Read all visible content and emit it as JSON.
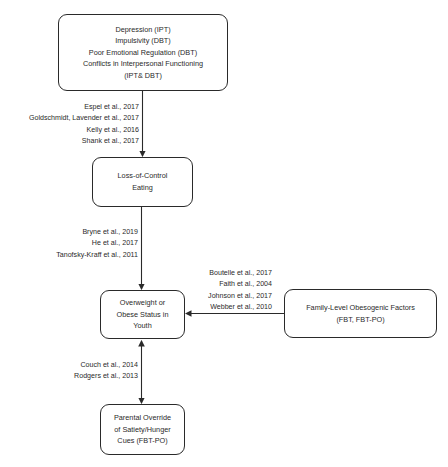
{
  "diagram": {
    "nodes": {
      "risk_factors": {
        "lines": [
          "Depression (IPT)",
          "Impulsivity (DBT)",
          "Poor Emotional Regulation (DBT)",
          "Conflicts in Interpersonal Functioning",
          "(IPT& DBT)"
        ]
      },
      "loc_eating": {
        "lines": [
          "Loss-of-Control",
          "Eating"
        ]
      },
      "overweight": {
        "lines": [
          "Overweight or",
          "Obese Status in",
          "Youth"
        ]
      },
      "family": {
        "lines": [
          "Family-Level Obesogenic Factors",
          "(FBT, FBT-PO)"
        ]
      },
      "parental": {
        "lines": [
          "Parental Override",
          "of Satiety/Hunger",
          "Cues (FBT-PO)"
        ]
      }
    },
    "edges": [
      {
        "from": "risk_factors",
        "to": "loc_eating",
        "direction": "forward",
        "citations": [
          "Espel et al., 2017",
          "Goldschmidt, Lavender et al., 2017",
          "Kelly et al., 2016",
          "Shank et al., 2017"
        ]
      },
      {
        "from": "loc_eating",
        "to": "overweight",
        "direction": "forward",
        "citations": [
          "Bryne et al., 2019",
          "He et al., 2017",
          "Tanofsky-Kraff et al., 2011"
        ]
      },
      {
        "from": "family",
        "to": "overweight",
        "direction": "forward",
        "citations": [
          "Boutelle et al., 2017",
          "Faith et al., 2004",
          "Johnson et al., 2017",
          "Webber et al., 2010"
        ]
      },
      {
        "from": "overweight",
        "to": "parental",
        "direction": "bidirectional",
        "citations": [
          "Couch et al., 2014",
          "Rodgers et al., 2013"
        ]
      }
    ],
    "colors": {
      "stroke": "#2a2a2a",
      "background": "#ffffff"
    }
  }
}
